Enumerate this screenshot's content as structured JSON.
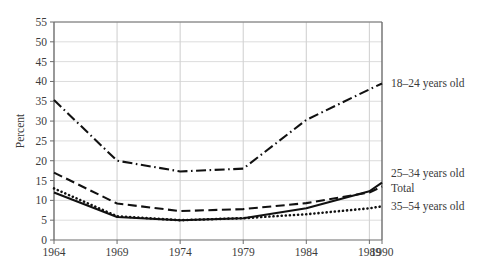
{
  "chart_data": {
    "type": "line",
    "title": "",
    "subtitle": "",
    "xlabel": "",
    "ylabel": "Percent",
    "xlim": [
      1964,
      1990
    ],
    "ylim": [
      0,
      55
    ],
    "ytick_step": 5,
    "grid": true,
    "legend_position": "right-inline",
    "x": [
      1964,
      1969,
      1974,
      1979,
      1984,
      1989,
      1990
    ],
    "xtick_labels": [
      "1964",
      "1969",
      "1974",
      "1979",
      "1984",
      "1989",
      "1990"
    ],
    "ytick_labels": [
      "0",
      "5",
      "10",
      "15",
      "20",
      "25",
      "30",
      "35",
      "40",
      "45",
      "50",
      "55"
    ],
    "ytick_values": [
      0,
      5,
      10,
      15,
      20,
      25,
      30,
      35,
      40,
      45,
      50,
      55
    ],
    "series": [
      {
        "name": "18-24 years old",
        "label": "18–24 years old",
        "linestyle": "dashdot",
        "color": "#111111",
        "values": [
          35.3,
          20.0,
          17.3,
          18.0,
          30.3,
          38.0,
          39.5
        ],
        "label_y": 39.5
      },
      {
        "name": "25-34 years old",
        "label": "25–34 years old",
        "linestyle": "solid",
        "color": "#111111",
        "values": [
          12.0,
          5.8,
          5.0,
          5.5,
          8.0,
          12.3,
          14.5
        ],
        "label_y": 17.0
      },
      {
        "name": "Total",
        "label": "Total",
        "linestyle": "dashed",
        "color": "#111111",
        "values": [
          17.0,
          9.2,
          7.3,
          7.8,
          9.3,
          12.0,
          13.5
        ],
        "label_y": 13.2
      },
      {
        "name": "35-54 years old",
        "label": "35–54 years old",
        "linestyle": "dotted",
        "color": "#111111",
        "values": [
          13.0,
          6.0,
          5.0,
          5.5,
          6.5,
          8.0,
          8.5
        ],
        "label_y": 8.6
      }
    ],
    "colors": {
      "line": "#111111",
      "grid": "#dcdcdc",
      "axis": "#6d6d6d",
      "text": "#3b3b3b",
      "background": "#ffffff"
    }
  }
}
